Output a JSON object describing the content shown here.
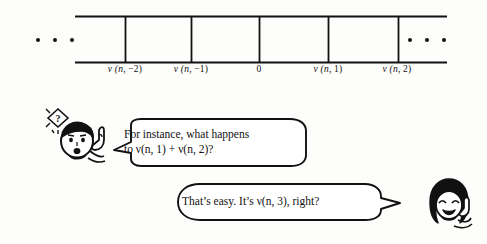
{
  "figure": {
    "type": "number-line-strip-with-dialogue",
    "strip": {
      "left_ellipsis": "· · ·",
      "right_ellipsis": "· · ·",
      "cell_labels": [
        {
          "id": "nu-n-minus-2",
          "prefix": "ν",
          "args": "(n, −2)",
          "text": "ν (n, −2)"
        },
        {
          "id": "nu-n-minus-1",
          "prefix": "ν",
          "args": "(n, −1)",
          "text": "ν (n, −1)"
        },
        {
          "id": "zero",
          "prefix": "",
          "args": "",
          "text": "0"
        },
        {
          "id": "nu-n-1",
          "prefix": "ν",
          "args": "(n, 1)",
          "text": "ν (n, 1)"
        },
        {
          "id": "nu-n-2",
          "prefix": "ν",
          "args": "(n, 2)",
          "text": "ν (n, 2)"
        }
      ]
    },
    "dialogue": [
      {
        "speaker": "boy",
        "line_1": "For instance, what happens",
        "line_2": "to ν(n, 1) + ν(n, 2)?",
        "tail": "left"
      },
      {
        "speaker": "girl",
        "line_1": "That’s easy. It’s ν(n, 3), right?",
        "line_2": "",
        "tail": "right"
      }
    ],
    "characters": [
      {
        "id": "boy-character",
        "name": "boy-with-question-spark",
        "badge": "?"
      },
      {
        "id": "girl-character",
        "name": "girl-smiling-waving",
        "badge": ""
      }
    ],
    "colors": {
      "ink": "#111111",
      "paper": "#fdfdfc"
    }
  }
}
